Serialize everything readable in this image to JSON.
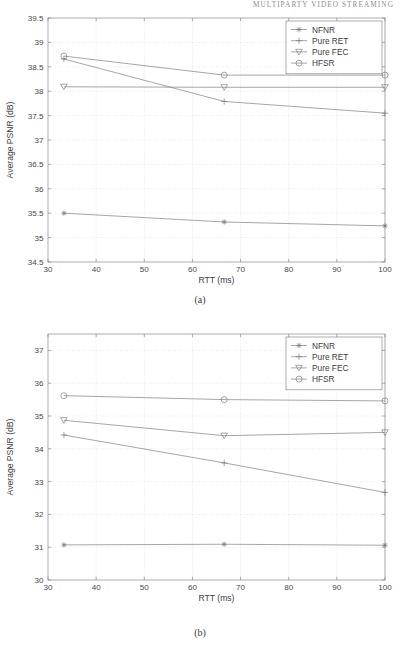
{
  "running_head": "MULTIPARTY VIDEO STREAMING",
  "figures": [
    {
      "id": "a",
      "caption": "(a)",
      "legend_title": "legend",
      "chart_data": {
        "type": "line",
        "title": "",
        "xlabel": "RTT (ms)",
        "ylabel": "Average PSNR (dB)",
        "xlim": [
          30,
          100
        ],
        "ylim": [
          34.5,
          39.5
        ],
        "xticks": [
          30,
          40,
          50,
          60,
          70,
          80,
          90,
          100
        ],
        "xticklabels": [
          "30",
          "40",
          "50",
          "60",
          "70",
          "80",
          "90",
          "100"
        ],
        "yticks": [
          34.5,
          35,
          35.5,
          36,
          36.5,
          37,
          37.5,
          38,
          38.5,
          39,
          39.5
        ],
        "yticklabels": [
          "34.5",
          "35",
          "35.5",
          "36",
          "36.5",
          "37",
          "37.5",
          "38",
          "38.5",
          "39",
          "39.5"
        ],
        "grid": true,
        "legend_position": "upper right",
        "x": [
          33.3,
          66.6,
          100
        ],
        "series": [
          {
            "name": "NFNR",
            "marker": "star",
            "values": [
              35.5,
              35.32,
              35.24
            ]
          },
          {
            "name": "Pure RET",
            "marker": "plus",
            "values": [
              38.66,
              37.79,
              37.55
            ]
          },
          {
            "name": "Pure FEC",
            "marker": "triangle-down",
            "values": [
              38.09,
              38.08,
              38.08
            ]
          },
          {
            "name": "HFSR",
            "marker": "circle",
            "values": [
              38.72,
              38.33,
              38.33
            ]
          }
        ]
      }
    },
    {
      "id": "b",
      "caption": "(b)",
      "legend_title": "legend",
      "chart_data": {
        "type": "line",
        "title": "",
        "xlabel": "RTT (ms)",
        "ylabel": "Average PSNR (dB)",
        "xlim": [
          30,
          100
        ],
        "ylim": [
          30,
          37.5
        ],
        "xticks": [
          30,
          40,
          50,
          60,
          70,
          80,
          90,
          100
        ],
        "xticklabels": [
          "30",
          "40",
          "50",
          "60",
          "70",
          "80",
          "90",
          "100"
        ],
        "yticks": [
          30,
          31,
          32,
          33,
          34,
          35,
          36,
          37
        ],
        "yticklabels": [
          "30",
          "31",
          "32",
          "33",
          "34",
          "35",
          "36",
          "37"
        ],
        "grid": true,
        "legend_position": "upper right",
        "x": [
          33.3,
          66.6,
          100
        ],
        "series": [
          {
            "name": "NFNR",
            "marker": "star",
            "values": [
              31.07,
              31.09,
              31.06
            ]
          },
          {
            "name": "Pure RET",
            "marker": "plus",
            "values": [
              34.42,
              33.57,
              32.67
            ]
          },
          {
            "name": "Pure FEC",
            "marker": "triangle-down",
            "values": [
              34.87,
              34.4,
              34.5
            ]
          },
          {
            "name": "HFSR",
            "marker": "circle",
            "values": [
              35.62,
              35.5,
              35.46
            ]
          }
        ]
      }
    }
  ]
}
